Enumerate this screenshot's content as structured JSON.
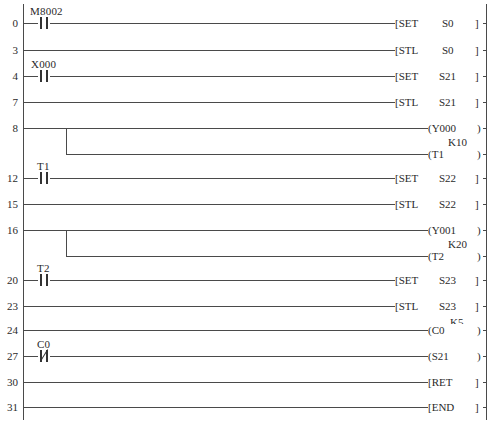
{
  "diagram": {
    "type": "PLC ladder diagram (STL step ladder)",
    "rails": {
      "left_x": 23,
      "right_x": 486,
      "top_y": 4,
      "bottom_y": 420
    },
    "rungs": [
      {
        "step": "0",
        "y": 23,
        "contact": {
          "device": "M8002",
          "type": "NO"
        },
        "instruction": {
          "bracket": "[",
          "op": "SET",
          "arg": "S0",
          "close": "]"
        }
      },
      {
        "step": "3",
        "y": 50,
        "contact": null,
        "instruction": {
          "bracket": "[",
          "op": "STL",
          "arg": "S0",
          "close": "]"
        }
      },
      {
        "step": "4",
        "y": 76,
        "contact": {
          "device": "X000",
          "type": "NO"
        },
        "instruction": {
          "bracket": "[",
          "op": "SET",
          "arg": "S21",
          "close": "]"
        }
      },
      {
        "step": "7",
        "y": 102,
        "contact": null,
        "instruction": {
          "bracket": "[",
          "op": "STL",
          "arg": "S21",
          "close": "]"
        }
      },
      {
        "step": "8",
        "y": 128,
        "contact": null,
        "coil": {
          "bracket": "(",
          "device": "Y000",
          "close": ")"
        },
        "branch": {
          "y": 154,
          "coil": {
            "bracket": "(",
            "device": "T1",
            "close": ")",
            "preset": "K10"
          }
        }
      },
      {
        "step": "12",
        "y": 178,
        "contact": {
          "device": "T1",
          "type": "NO"
        },
        "instruction": {
          "bracket": "[",
          "op": "SET",
          "arg": "S22",
          "close": "]"
        }
      },
      {
        "step": "15",
        "y": 204,
        "contact": null,
        "instruction": {
          "bracket": "[",
          "op": "STL",
          "arg": "S22",
          "close": "]"
        }
      },
      {
        "step": "16",
        "y": 230,
        "contact": null,
        "coil": {
          "bracket": "(",
          "device": "Y001",
          "close": ")"
        },
        "branch": {
          "y": 256,
          "coil": {
            "bracket": "(",
            "device": "T2",
            "close": ")",
            "preset": "K20"
          }
        }
      },
      {
        "step": "20",
        "y": 280,
        "contact": {
          "device": "T2",
          "type": "NO"
        },
        "instruction": {
          "bracket": "[",
          "op": "SET",
          "arg": "S23",
          "close": "]"
        }
      },
      {
        "step": "23",
        "y": 306,
        "contact": null,
        "instruction": {
          "bracket": "[",
          "op": "STL",
          "arg": "S23",
          "close": "]"
        }
      },
      {
        "step": "24",
        "y": 330,
        "contact": null,
        "coil": {
          "bracket": "(",
          "device": "C0",
          "close": ")",
          "preset": "K5"
        }
      },
      {
        "step": "27",
        "y": 356,
        "contact": {
          "device": "C0",
          "type": "NC"
        },
        "coil": {
          "bracket": "(",
          "device": "S21",
          "close": ")"
        }
      },
      {
        "step": "30",
        "y": 382,
        "contact": null,
        "instruction": {
          "bracket": "[",
          "op": "RET",
          "arg": "",
          "close": "]"
        }
      },
      {
        "step": "31",
        "y": 407,
        "contact": null,
        "instruction": {
          "bracket": "[",
          "op": "END",
          "arg": "",
          "close": "]"
        }
      }
    ]
  },
  "labels": {
    "steps": [
      "0",
      "3",
      "4",
      "7",
      "8",
      "12",
      "15",
      "16",
      "20",
      "23",
      "24",
      "27",
      "30",
      "31"
    ],
    "r0_contact": "M8002",
    "r0_op": "[SET",
    "r0_arg": "S0",
    "r0_close": "]",
    "r3_op": "[STL",
    "r3_arg": "S0",
    "r3_close": "]",
    "r4_contact": "X000",
    "r4_op": "[SET",
    "r4_arg": "S21",
    "r4_close": "]",
    "r7_op": "[STL",
    "r7_arg": "S21",
    "r7_close": "]",
    "r8_coil": "(Y000",
    "r8_close": ")",
    "r8b_preset": "K10",
    "r8b_coil": "(T1",
    "r8b_close": ")",
    "r12_contact": "T1",
    "r12_op": "[SET",
    "r12_arg": "S22",
    "r12_close": "]",
    "r15_op": "[STL",
    "r15_arg": "S22",
    "r15_close": "]",
    "r16_coil": "(Y001",
    "r16_close": ")",
    "r16b_preset": "K20",
    "r16b_coil": "(T2",
    "r16b_close": ")",
    "r20_contact": "T2",
    "r20_op": "[SET",
    "r20_arg": "S23",
    "r20_close": "]",
    "r23_op": "[STL",
    "r23_arg": "S23",
    "r23_close": "]",
    "r24_preset": "K5",
    "r24_coil": "(C0",
    "r24_close": ")",
    "r27_contact": "C0",
    "r27_coil": "(S21",
    "r27_close": ")",
    "r30_op": "[RET",
    "r30_close": "]",
    "r31_op": "[END",
    "r31_close": "]"
  }
}
